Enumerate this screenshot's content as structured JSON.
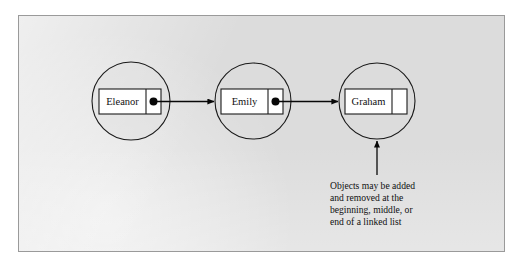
{
  "figure": {
    "frame": {
      "background_color": "#dcdcdc",
      "border_color": "#9a9a9a"
    },
    "nodes": [
      {
        "id": "node-1",
        "label": "Eleanor",
        "pointer": "filled",
        "cx": 131,
        "cy": 101,
        "r": 39
      },
      {
        "id": "node-2",
        "label": "Emily",
        "pointer": "filled",
        "cx": 253,
        "cy": 101,
        "r": 38
      },
      {
        "id": "node-3",
        "label": "Graham",
        "pointer": "null",
        "cx": 377,
        "cy": 101,
        "r": 38
      }
    ],
    "links": [
      {
        "id": "link-1",
        "from": "node-1",
        "to": "node-2"
      },
      {
        "id": "link-2",
        "from": "node-2",
        "to": "node-3"
      }
    ],
    "callout": {
      "target": "node-3",
      "lines": [
        "Objects may be added",
        "and removed at the",
        "beginning, middle, or",
        "end of a linked list"
      ]
    }
  }
}
